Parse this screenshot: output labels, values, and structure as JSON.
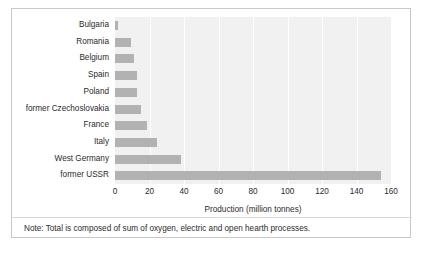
{
  "figure": {
    "note": "Note: Total is composed of sum of oxygen, electric and open hearth processes.",
    "colors": {
      "bar": "#b2b2b2",
      "plot_background": "#f1f1f1",
      "gridline": "#ffffff",
      "border": "#c8c8c8",
      "text": "#2b2b2b"
    }
  },
  "chart_data": {
    "type": "bar",
    "orientation": "horizontal",
    "title": "",
    "xlabel": "Production (million tonnes)",
    "ylabel": "",
    "xlim": [
      0,
      160
    ],
    "xticks": [
      0,
      20,
      40,
      60,
      80,
      100,
      120,
      140,
      160
    ],
    "xtick_labels": [
      "0",
      "20",
      "40",
      "60",
      "80",
      "100",
      "120",
      "140",
      "160"
    ],
    "grid": true,
    "legend": false,
    "categories": [
      "Bulgaria",
      "Romania",
      "Belgium",
      "Spain",
      "Poland",
      "former Czechoslovakia",
      "France",
      "Italy",
      "West Germany",
      "former USSR"
    ],
    "values": [
      2,
      9,
      11,
      12.5,
      13,
      15,
      18.5,
      24.5,
      38,
      154
    ],
    "annotation": "Note: Total is composed of sum of oxygen, electric and open hearth processes."
  }
}
